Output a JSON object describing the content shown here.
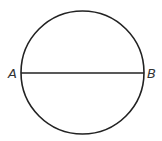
{
  "diagram": {
    "type": "circle-with-diameter",
    "circle": {
      "cx": 82.5,
      "cy": 72.5,
      "r": 61.5,
      "stroke": "#222222",
      "stroke_width": 1.6
    },
    "diameter": {
      "x1": 21,
      "y1": 73,
      "x2": 144,
      "y2": 73,
      "stroke": "#222222",
      "stroke_width": 1.6
    },
    "points": [
      {
        "label": "A",
        "x": 8,
        "y": 78
      },
      {
        "label": "B",
        "x": 147,
        "y": 78
      }
    ]
  }
}
